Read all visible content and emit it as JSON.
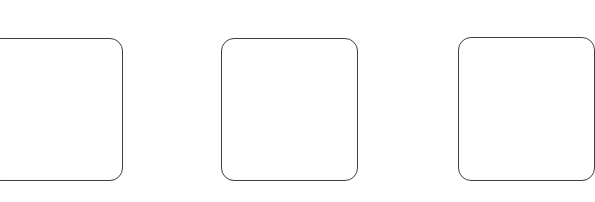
{
  "canvas": {
    "width": 595,
    "height": 202,
    "background": "#ffffff"
  },
  "style": {
    "border_color": "#3f3f3f",
    "border_radius": 13
  },
  "tiles": [
    {
      "id": "tile-1",
      "left": -12,
      "top": 38,
      "width": 135,
      "height": 143
    },
    {
      "id": "tile-2",
      "left": 221,
      "top": 38,
      "width": 137,
      "height": 143
    },
    {
      "id": "tile-3",
      "left": 458,
      "top": 37,
      "width": 137,
      "height": 144
    }
  ]
}
